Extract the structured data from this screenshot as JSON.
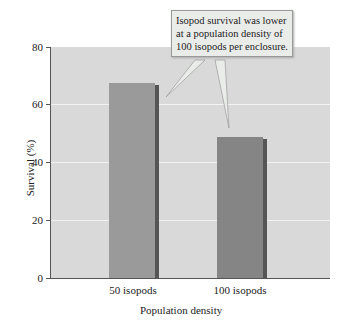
{
  "chart_data": {
    "type": "bar",
    "title": "",
    "xlabel": "Population density",
    "ylabel": "Survival (%)",
    "categories": [
      "50 isopods",
      "100 isopods"
    ],
    "values": [
      67.5,
      49
    ],
    "ylim": [
      0,
      80
    ],
    "yticks": [
      0,
      20,
      40,
      60,
      80
    ],
    "grid": true,
    "bar_colors": [
      "#9a9a9a",
      "#858585"
    ],
    "annotations": [
      "Isopod survival was lower at a population density of 100 isopods per enclosure."
    ]
  },
  "callout": {
    "text": "Isopod survival was lower at a population density of 100 isopods per enclosure."
  },
  "axis": {
    "x_title": "Population density",
    "y_title": "Survival (%)",
    "y_ticks": [
      "0",
      "20",
      "40",
      "60",
      "80"
    ],
    "x_ticks": [
      "50 isopods",
      "100 isopods"
    ]
  }
}
